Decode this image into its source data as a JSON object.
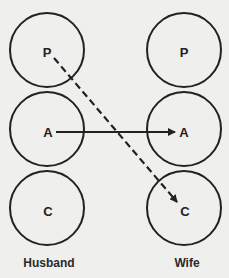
{
  "diagram": {
    "colors": {
      "stroke": "#222222",
      "background": "#efefed"
    },
    "columns": [
      {
        "id": "husband",
        "label": "Husband",
        "states": [
          {
            "id": "P",
            "label": "P",
            "cx": 47,
            "cy": 50
          },
          {
            "id": "A",
            "label": "A",
            "cx": 47,
            "cy": 129
          },
          {
            "id": "C",
            "label": "C",
            "cx": 47,
            "cy": 208
          }
        ]
      },
      {
        "id": "wife",
        "label": "Wife",
        "states": [
          {
            "id": "P",
            "label": "P",
            "cx": 184,
            "cy": 50
          },
          {
            "id": "A",
            "label": "A",
            "cx": 184,
            "cy": 129
          },
          {
            "id": "C",
            "label": "C",
            "cx": 184,
            "cy": 208
          }
        ]
      }
    ],
    "radius": 37,
    "transactions": [
      {
        "from": "husband.A",
        "to": "wife.A",
        "style": "solid"
      },
      {
        "from": "husband.P",
        "to": "wife.C",
        "style": "dashed"
      }
    ]
  }
}
